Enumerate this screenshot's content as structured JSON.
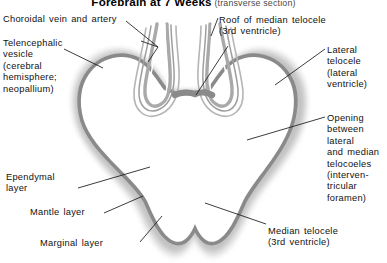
{
  "figure": {
    "title_main": "Forebrain at 7 Weeks",
    "title_sub": " (transverse section)",
    "view": "transverse section",
    "background_color": "#ffffff"
  },
  "colors": {
    "ependymal_layer": "#8c8c8c",
    "mantle_layer": "#bdbdbd",
    "marginal_layer": "#e0e0e0",
    "lumen": "#ffffff",
    "leader_line": "#1a1a1a",
    "text": "#111111",
    "shadow": "#d9d9d9"
  },
  "labels": {
    "choroidal": "Choroidal vein and artery",
    "telencephalic": "Telencephalic\nvesicle\n(cerebral\nhemisphere;\nneopallium)",
    "roof": "Roof of median telocele\n(3rd ventricle)",
    "lateral": "Lateral\ntelocele\n(lateral\nventricle)",
    "opening": "Opening\nbetween\nlateral\nand median\ntelocoeles\n(interven-\ntricular\nforamen)",
    "ependymal": "Ependymal\nlayer",
    "mantle": "Mantle layer",
    "marginal": "Marginal layer",
    "median": "Median telocele\n(3rd ventricle)"
  },
  "structures": [
    {
      "name": "telencephalic-vesicle-left",
      "description": "Left cerebral hemisphere lumen"
    },
    {
      "name": "telencephalic-vesicle-right",
      "description": "Right cerebral hemisphere lumen"
    },
    {
      "name": "median-telocele",
      "description": "Third ventricle, midline cavity"
    },
    {
      "name": "choroid-plexus-left",
      "description": "Left invaginated choroid plexus fold"
    },
    {
      "name": "choroid-plexus-right",
      "description": "Right invaginated choroid plexus fold"
    },
    {
      "name": "roof-of-median-telocele",
      "description": "Thin midline roof between the two folds"
    },
    {
      "name": "interventricular-foramen",
      "description": "Opening between lateral and median telocoeles"
    }
  ],
  "wall_layers": [
    {
      "name": "ependymal-layer",
      "order": 1,
      "position": "innermost"
    },
    {
      "name": "mantle-layer",
      "order": 2,
      "position": "middle"
    },
    {
      "name": "marginal-layer",
      "order": 3,
      "position": "outermost"
    }
  ]
}
